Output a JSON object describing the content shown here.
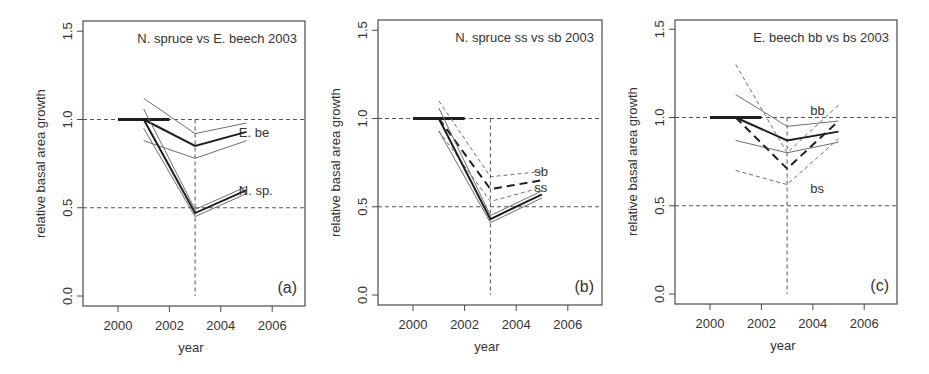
{
  "figure": {
    "y_label": "relative basal area growth",
    "x_label": "year",
    "y_ticks": [
      "0.0",
      "0.5",
      "1.0",
      "1.5"
    ],
    "x_ticks": [
      "2000",
      "2002",
      "2004",
      "2006"
    ]
  },
  "colors": {
    "axis": "#4a4a4a",
    "text": "#333333",
    "line_thin": "#6e6e6e",
    "line_bold": "#1e1e1e",
    "reference": "#555555",
    "background": "#ffffff"
  },
  "chart_data": [
    {
      "type": "line",
      "panel_label": "(a)",
      "title": "N. spruce vs E. beech 2003",
      "xlabel": "year",
      "ylabel": "relative basal area growth",
      "xlim": [
        1998.7,
        2007.3
      ],
      "ylim": [
        -0.06,
        1.56
      ],
      "x_ticks": [
        2000,
        2002,
        2004,
        2006
      ],
      "y_ticks": [
        0.0,
        0.5,
        1.0,
        1.5
      ],
      "reference_lines": {
        "h": [
          1.0,
          0.5
        ],
        "v": 2003
      },
      "baseline": {
        "x": [
          2000,
          2002
        ],
        "y": [
          1.0,
          1.0
        ]
      },
      "annotations": [
        {
          "text": "E. be",
          "x": 2004.7,
          "y": 0.93
        },
        {
          "text": "N. sp.",
          "x": 2004.7,
          "y": 0.6
        }
      ],
      "series": [
        {
          "name": "E. beech upper CI",
          "style": "thin",
          "x": [
            2001,
            2003,
            2005
          ],
          "y": [
            1.12,
            0.92,
            0.98
          ]
        },
        {
          "name": "E. beech mean",
          "style": "bold",
          "x": [
            2001,
            2003,
            2005
          ],
          "y": [
            1.0,
            0.85,
            0.93
          ]
        },
        {
          "name": "E. beech lower CI",
          "style": "thin",
          "x": [
            2001,
            2003,
            2005
          ],
          "y": [
            0.88,
            0.78,
            0.88
          ]
        },
        {
          "name": "N. spruce upper CI",
          "style": "thin",
          "x": [
            2001,
            2003,
            2005
          ],
          "y": [
            1.06,
            0.49,
            0.62
          ]
        },
        {
          "name": "N. spruce mean",
          "style": "bold",
          "x": [
            2001,
            2003,
            2005
          ],
          "y": [
            1.0,
            0.47,
            0.6
          ]
        },
        {
          "name": "N. spruce lower CI",
          "style": "thin",
          "x": [
            2001,
            2003,
            2005
          ],
          "y": [
            0.95,
            0.45,
            0.58
          ]
        }
      ]
    },
    {
      "type": "line",
      "panel_label": "(b)",
      "title": "N. spruce ss vs sb 2003",
      "xlabel": "year",
      "ylabel": "relative basal area growth",
      "xlim": [
        1998.7,
        2007.3
      ],
      "ylim": [
        -0.06,
        1.56
      ],
      "x_ticks": [
        2000,
        2002,
        2004,
        2006
      ],
      "y_ticks": [
        0.0,
        0.5,
        1.0,
        1.5
      ],
      "reference_lines": {
        "h": [
          1.0,
          0.5
        ],
        "v": 2003
      },
      "baseline": {
        "x": [
          2000,
          2002
        ],
        "y": [
          1.0,
          1.0
        ]
      },
      "annotations": [
        {
          "text": "sb",
          "x": 2004.7,
          "y": 0.7
        },
        {
          "text": "ss",
          "x": 2004.7,
          "y": 0.61
        }
      ],
      "series": [
        {
          "name": "sb upper CI",
          "style": "thin-dashed",
          "x": [
            2001,
            2003,
            2005
          ],
          "y": [
            1.1,
            0.67,
            0.7
          ]
        },
        {
          "name": "sb mean",
          "style": "bold-dashed",
          "x": [
            2001,
            2003,
            2005
          ],
          "y": [
            1.0,
            0.6,
            0.65
          ]
        },
        {
          "name": "sb lower CI",
          "style": "thin-dashed",
          "x": [
            2001,
            2003,
            2005
          ],
          "y": [
            0.93,
            0.53,
            0.61
          ]
        },
        {
          "name": "ss upper CI",
          "style": "thin",
          "x": [
            2001,
            2003,
            2005
          ],
          "y": [
            1.06,
            0.45,
            0.59
          ]
        },
        {
          "name": "ss mean",
          "style": "bold",
          "x": [
            2001,
            2003,
            2005
          ],
          "y": [
            1.0,
            0.43,
            0.57
          ]
        },
        {
          "name": "ss lower CI",
          "style": "thin",
          "x": [
            2001,
            2003,
            2005
          ],
          "y": [
            0.93,
            0.41,
            0.55
          ]
        }
      ]
    },
    {
      "type": "line",
      "panel_label": "(c)",
      "title": "E. beech bb vs bs 2003",
      "xlabel": "year",
      "ylabel": "relative basal area growth",
      "xlim": [
        1998.7,
        2007.3
      ],
      "ylim": [
        -0.06,
        1.56
      ],
      "x_ticks": [
        2000,
        2002,
        2004,
        2006
      ],
      "y_ticks": [
        0.0,
        0.5,
        1.0,
        1.5
      ],
      "reference_lines": {
        "h": [
          1.0,
          0.5
        ],
        "v": 2003
      },
      "baseline": {
        "x": [
          2000,
          2002
        ],
        "y": [
          1.0,
          1.0
        ]
      },
      "annotations": [
        {
          "text": "bb",
          "x": 2003.9,
          "y": 1.04
        },
        {
          "text": "bs",
          "x": 2003.9,
          "y": 0.6
        }
      ],
      "series": [
        {
          "name": "bb upper CI",
          "style": "thin",
          "x": [
            2001,
            2003,
            2005
          ],
          "y": [
            1.13,
            0.95,
            0.98
          ]
        },
        {
          "name": "bb mean",
          "style": "bold",
          "x": [
            2001,
            2003,
            2005
          ],
          "y": [
            1.0,
            0.87,
            0.92
          ]
        },
        {
          "name": "bb lower CI",
          "style": "thin",
          "x": [
            2001,
            2003,
            2005
          ],
          "y": [
            0.87,
            0.8,
            0.86
          ]
        },
        {
          "name": "bs upper CI",
          "style": "thin-dashed",
          "x": [
            2001,
            2003,
            2005
          ],
          "y": [
            1.3,
            0.8,
            1.07
          ]
        },
        {
          "name": "bs mean",
          "style": "bold-dashed",
          "x": [
            2001,
            2003,
            2005
          ],
          "y": [
            1.0,
            0.71,
            0.98
          ]
        },
        {
          "name": "bs lower CI",
          "style": "thin-dashed",
          "x": [
            2001,
            2003,
            2005
          ],
          "y": [
            0.7,
            0.62,
            0.88
          ]
        }
      ]
    }
  ],
  "layout": {
    "panels": [
      {
        "frame": [
          83,
          21,
          305,
          306
        ],
        "x2000": 118,
        "px_per_year": 25.7,
        "y0": 296,
        "px_per_unit": 176.5
      },
      {
        "frame": [
          378,
          20,
          602,
          305
        ],
        "x2000": 413,
        "px_per_year": 25.8,
        "y0": 295,
        "px_per_unit": 176.5
      },
      {
        "frame": [
          675,
          20,
          897,
          304
        ],
        "x2000": 710,
        "px_per_year": 25.7,
        "y0": 294,
        "px_per_unit": 176.5
      }
    ]
  }
}
